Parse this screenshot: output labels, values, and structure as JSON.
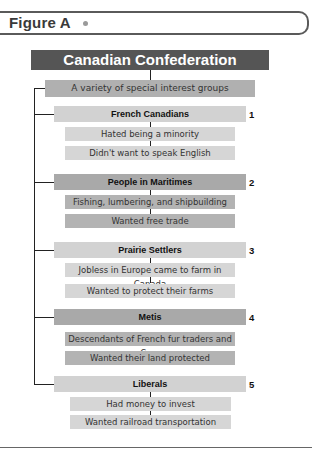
{
  "figure": {
    "label": "Figure A"
  },
  "diagram": {
    "title": "Canadian Confederation",
    "root": "A variety of special interest groups",
    "groups": [
      {
        "number": "1",
        "name": "French Canadians",
        "shade": "light",
        "points": [
          "Hated being a minority",
          "Didn't want to speak English"
        ]
      },
      {
        "number": "2",
        "name": "People in Maritimes",
        "shade": "dark",
        "points": [
          "Fishing, lumbering, and shipbuilding",
          "Wanted free trade"
        ]
      },
      {
        "number": "3",
        "name": "Prairie Settlers",
        "shade": "light",
        "points": [
          "Jobless in Europe came to farm in Canada",
          "Wanted to protect their farms"
        ]
      },
      {
        "number": "4",
        "name": "Metis",
        "shade": "dark",
        "points": [
          "Descendants of French fur traders and Cree",
          "Wanted their land protected"
        ]
      },
      {
        "number": "5",
        "name": "Liberals",
        "shade": "light",
        "points": [
          "Had money to invest",
          "Wanted railroad transportation"
        ]
      }
    ]
  },
  "colors": {
    "title_bar": "#555555",
    "light_box": "#d2d2d2",
    "dark_box": "#a9a9a9",
    "root_box": "#b0b0b0"
  }
}
